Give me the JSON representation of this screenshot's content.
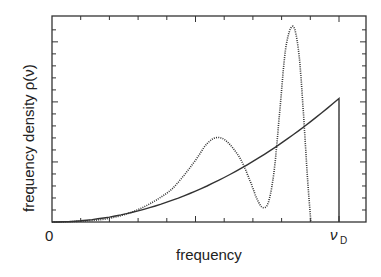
{
  "chart_data": {
    "type": "line",
    "title": "",
    "xlabel": "frequency",
    "ylabel": "frequency density ρ(ν)",
    "xlim": [
      0,
      1.09
    ],
    "ylim": [
      0,
      1.0
    ],
    "x_tick_labels": [
      {
        "value": 0,
        "label": "0"
      },
      {
        "value": 1,
        "label": "ν_D",
        "main": "ν",
        "sub": "D"
      }
    ],
    "x_minor_tick_step": 0.1,
    "y_minor_tick_step": 0.0583,
    "grid": false,
    "legend": "none",
    "series": [
      {
        "name": "Debye model",
        "style": "solid",
        "color": "#333333",
        "x": [
          0,
          0.1,
          0.2,
          0.3,
          0.4,
          0.5,
          0.6,
          0.7,
          0.8,
          0.9,
          1.0,
          1.0
        ],
        "y": [
          0,
          0.006,
          0.024,
          0.054,
          0.096,
          0.15,
          0.216,
          0.294,
          0.384,
          0.486,
          0.6,
          0
        ]
      },
      {
        "name": "actual spectrum",
        "style": "dotted",
        "color": "#333333",
        "x": [
          0,
          0.1,
          0.2,
          0.3,
          0.4,
          0.45,
          0.5,
          0.54,
          0.575,
          0.61,
          0.655,
          0.69,
          0.715,
          0.735,
          0.755,
          0.775,
          0.795,
          0.815,
          0.84,
          0.86,
          0.875,
          0.89,
          0.902
        ],
        "y": [
          0,
          0.004,
          0.018,
          0.06,
          0.14,
          0.21,
          0.3,
          0.38,
          0.41,
          0.39,
          0.31,
          0.2,
          0.11,
          0.07,
          0.1,
          0.26,
          0.56,
          0.85,
          0.95,
          0.82,
          0.55,
          0.22,
          0
        ]
      }
    ]
  }
}
